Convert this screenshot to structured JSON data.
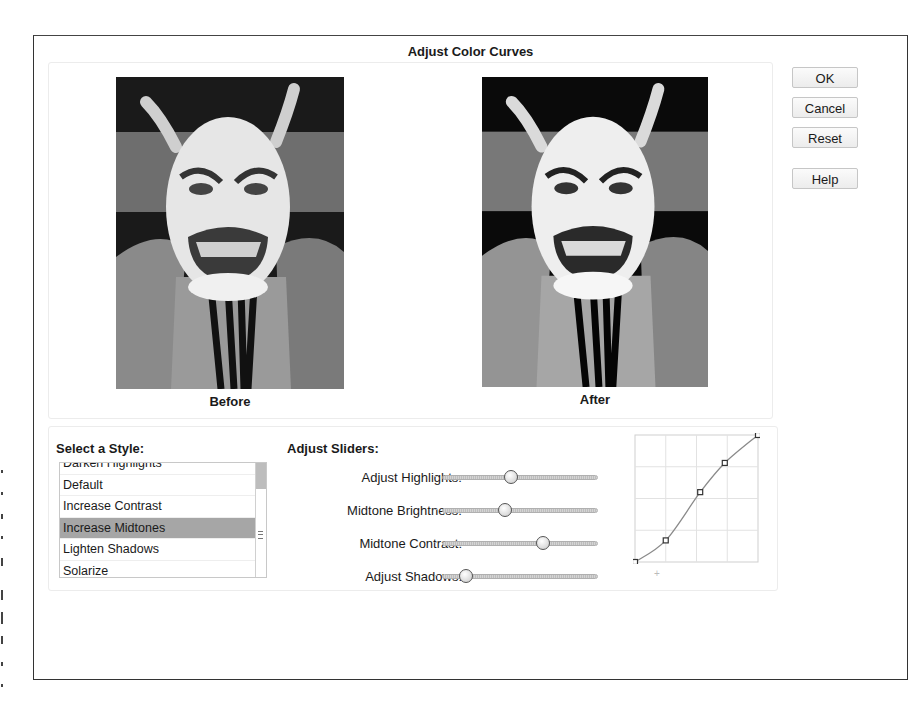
{
  "dialog": {
    "title": "Adjust Color Curves"
  },
  "preview": {
    "before": {
      "caption": "Before",
      "image": "noh-demon-mask-grayscale"
    },
    "after": {
      "caption": "After",
      "image": "noh-demon-mask-grayscale-adjusted"
    }
  },
  "buttons": {
    "ok": "OK",
    "cancel": "Cancel",
    "reset": "Reset",
    "help": "Help"
  },
  "style_list": {
    "label": "Select a Style:",
    "items": [
      {
        "label": "Darken Highlights",
        "partial": true
      },
      {
        "label": "Default"
      },
      {
        "label": "Increase Contrast"
      },
      {
        "label": "Increase Midtones",
        "selected": true
      },
      {
        "label": "Lighten Shadows"
      },
      {
        "label": "Solarize"
      }
    ],
    "selected": "Increase Midtones"
  },
  "sliders": {
    "label": "Adjust Sliders:",
    "minus_symbol": "-",
    "plus_symbol": "+",
    "items": [
      {
        "label": "Adjust Highlights:",
        "value_pct": 44
      },
      {
        "label": "Midtone Brightness:",
        "value_pct": 40
      },
      {
        "label": "Midtone Contrast:",
        "value_pct": 65
      },
      {
        "label": "Adjust Shadows:",
        "value_pct": 15
      }
    ]
  },
  "curve": {
    "grid_divisions": 4,
    "points": [
      [
        0,
        0
      ],
      [
        0.25,
        0.17
      ],
      [
        0.53,
        0.55
      ],
      [
        0.73,
        0.78
      ],
      [
        1,
        1
      ]
    ],
    "colors": {
      "grid": "#e2e2e2",
      "line": "#8a8a8a",
      "point": "#333333"
    }
  }
}
